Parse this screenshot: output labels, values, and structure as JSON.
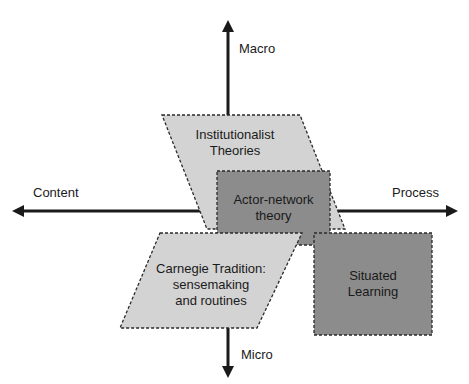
{
  "diagram": {
    "axes": {
      "vertical": {
        "top_label": "Macro",
        "bottom_label": "Micro"
      },
      "horizontal": {
        "left_label": "Content",
        "right_label": "Process"
      }
    },
    "shapes": [
      {
        "id": "institutionalist",
        "type": "parallelogram",
        "fill": "#d3d3d3",
        "lines": [
          "Institutionalist",
          "Theories"
        ]
      },
      {
        "id": "actor-network",
        "type": "rectangle",
        "fill": "#8c8c8c",
        "lines": [
          "Actor-network",
          "theory"
        ]
      },
      {
        "id": "carnegie",
        "type": "parallelogram",
        "fill": "#d3d3d3",
        "lines": [
          "Carnegie Tradition:",
          "sensemaking",
          "and routines"
        ]
      },
      {
        "id": "situated-learning",
        "type": "rectangle",
        "fill": "#8c8c8c",
        "lines": [
          "Situated",
          "Learning"
        ]
      }
    ],
    "colors": {
      "light_fill": "#d3d3d3",
      "dark_fill": "#8c8c8c",
      "border": "#2a2a2a",
      "axis": "#1a1a1a"
    }
  }
}
